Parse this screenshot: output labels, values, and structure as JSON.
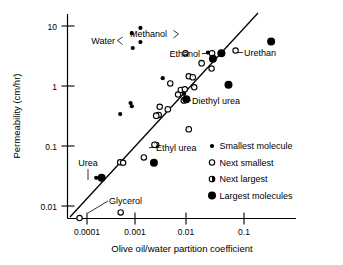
{
  "chart_data": {
    "type": "scatter",
    "title": "",
    "xlabel": "Olive oil/water partition coefficient",
    "ylabel": "Permeability (cm/hr)",
    "xscale": "log",
    "yscale": "log",
    "xlim": [
      5e-05,
      0.5
    ],
    "ylim": [
      0.005,
      20
    ],
    "grid": false,
    "xticks": [
      "0.0001",
      "0.001",
      "0.01",
      "0.1"
    ],
    "xtick_values": [
      0.0001,
      0.001,
      0.01,
      0.1
    ],
    "yticks": [
      "10",
      "1",
      "0.1",
      "0.01"
    ],
    "ytick_values": [
      10,
      1,
      0.1,
      0.01
    ],
    "legend_position": "lower right",
    "legend": [
      {
        "key": "smallest",
        "label": "Smallest molecule",
        "marker": "small-filled-circle"
      },
      {
        "key": "next_smallest",
        "label": "Next smallest",
        "marker": "open-circle"
      },
      {
        "key": "next_largest",
        "label": "Next largest",
        "marker": "half-filled-circle"
      },
      {
        "key": "largest",
        "label": "Largest molecules",
        "marker": "large-filled-circle"
      }
    ],
    "fit_line": {
      "description": "regression line through data",
      "x_start": 6.2e-05,
      "y_start": 0.0056,
      "x_end": 0.072,
      "y_end": 9.6
    },
    "series": [
      {
        "name": "Smallest molecule",
        "marker": "small-filled-circle",
        "points": [
          {
            "x": 0.00072,
            "y": 7.6
          },
          {
            "x": 0.00075,
            "y": 4.3
          },
          {
            "x": 0.00105,
            "y": 9.3
          },
          {
            "x": 0.00105,
            "y": 5.4
          },
          {
            "x": 0.00043,
            "y": 0.34
          },
          {
            "x": 0.00068,
            "y": 0.52
          },
          {
            "x": 0.00072,
            "y": 0.46
          },
          {
            "x": 0.0028,
            "y": 1.35
          },
          {
            "x": 0.00195,
            "y": 0.0525
          },
          {
            "x": 0.00015,
            "y": 0.0295
          },
          {
            "x": 0.0066,
            "y": 0.82
          },
          {
            "x": 0.0072,
            "y": 0.74
          },
          {
            "x": 0.0205,
            "y": 3.6
          }
        ]
      },
      {
        "name": "Next smallest",
        "marker": "open-circle",
        "points": [
          {
            "x": 7.2e-05,
            "y": 0.0063
          },
          {
            "x": 0.00043,
            "y": 0.0535
          },
          {
            "x": 0.00049,
            "y": 0.0525
          },
          {
            "x": 0.00044,
            "y": 0.0078
          },
          {
            "x": 0.00122,
            "y": 0.0645
          },
          {
            "x": 0.0021,
            "y": 0.104
          },
          {
            "x": 0.00235,
            "y": 0.33
          },
          {
            "x": 0.00245,
            "y": 0.45
          },
          {
            "x": 0.0039,
            "y": 1.1
          },
          {
            "x": 0.0055,
            "y": 0.72
          },
          {
            "x": 0.0062,
            "y": 0.86
          },
          {
            "x": 0.0074,
            "y": 0.88
          },
          {
            "x": 0.0076,
            "y": 3.5
          },
          {
            "x": 0.0088,
            "y": 1.45
          },
          {
            "x": 0.0112,
            "y": 0.95
          },
          {
            "x": 0.024,
            "y": 1.95
          },
          {
            "x": 0.069,
            "y": 3.9
          }
        ]
      },
      {
        "name": "Next largest",
        "marker": "half-filled-circle",
        "points": [
          {
            "x": 0.00195,
            "y": 0.105
          },
          {
            "x": 0.0021,
            "y": 0.32
          },
          {
            "x": 0.0035,
            "y": 0.41
          },
          {
            "x": 0.0071,
            "y": 0.575
          },
          {
            "x": 0.0088,
            "y": 0.19
          },
          {
            "x": 0.0105,
            "y": 1.4
          },
          {
            "x": 0.0155,
            "y": 2.4
          },
          {
            "x": 0.0245,
            "y": 3.5
          }
        ]
      },
      {
        "name": "Largest molecules",
        "marker": "large-filled-circle",
        "points": [
          {
            "x": 0.00019,
            "y": 0.0295
          },
          {
            "x": 0.0019,
            "y": 0.0525
          },
          {
            "x": 0.0079,
            "y": 0.6
          },
          {
            "x": 0.0255,
            "y": 2.85
          },
          {
            "x": 0.037,
            "y": 3.5
          },
          {
            "x": 0.0505,
            "y": 1.05
          },
          {
            "x": 0.33,
            "y": 5.5
          }
        ]
      }
    ],
    "annotations": [
      {
        "key": "water",
        "label": "Water",
        "style": "bracket-right",
        "notes": "bracket points to two smallest-molecule points"
      },
      {
        "key": "methanol",
        "label": "Methanol",
        "style": "bracket-right",
        "notes": "bracket points to two smallest-molecule points"
      },
      {
        "key": "ethanol",
        "label": "Ethanol",
        "style": "dash-right"
      },
      {
        "key": "urethan",
        "label": "Urethan",
        "style": "dash-left"
      },
      {
        "key": "diethyl_urea",
        "label": "Diethyl urea",
        "style": "dash-left"
      },
      {
        "key": "ethyl_urea",
        "label": "Ethyl urea",
        "style": "dash-left"
      },
      {
        "key": "urea",
        "label": "Urea",
        "style": "leader-down"
      },
      {
        "key": "glycerol",
        "label": "Glycerol",
        "style": "leader-down-left"
      }
    ]
  }
}
